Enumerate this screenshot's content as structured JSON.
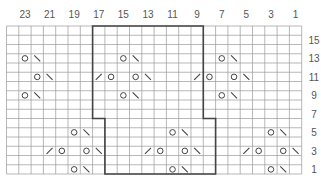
{
  "chart_title": "Knitting lace chart",
  "grid": {
    "columns": 24,
    "rows": 16,
    "left": 6.5,
    "top": 26,
    "cell_w": 12.3,
    "cell_h": 9.25,
    "line_color": "#999999",
    "outline_color": "#444444",
    "symbol_color": "#444444"
  },
  "column_labels": [
    "23",
    "21",
    "19",
    "17",
    "15",
    "13",
    "11",
    "9",
    "7",
    "5",
    "3",
    "1"
  ],
  "row_labels": [
    "15",
    "13",
    "11",
    "9",
    "7",
    "5",
    "3",
    "1"
  ],
  "legend_symbols": {
    "O": "yarn-over",
    "\\": "left-leaning decrease",
    "/": "right-leaning decrease"
  },
  "symbols": [
    {
      "row": 13,
      "col": 1,
      "s": "O"
    },
    {
      "row": 13,
      "col": 2,
      "s": "\\"
    },
    {
      "row": 13,
      "col": 9,
      "s": "O"
    },
    {
      "row": 13,
      "col": 10,
      "s": "\\"
    },
    {
      "row": 13,
      "col": 17,
      "s": "O"
    },
    {
      "row": 13,
      "col": 18,
      "s": "\\"
    },
    {
      "row": 11,
      "col": 2,
      "s": "O"
    },
    {
      "row": 11,
      "col": 3,
      "s": "\\"
    },
    {
      "row": 11,
      "col": 7,
      "s": "/"
    },
    {
      "row": 11,
      "col": 8,
      "s": "O"
    },
    {
      "row": 11,
      "col": 10,
      "s": "O"
    },
    {
      "row": 11,
      "col": 11,
      "s": "\\"
    },
    {
      "row": 11,
      "col": 15,
      "s": "/"
    },
    {
      "row": 11,
      "col": 16,
      "s": "O"
    },
    {
      "row": 11,
      "col": 18,
      "s": "O"
    },
    {
      "row": 11,
      "col": 19,
      "s": "\\"
    },
    {
      "row": 9,
      "col": 1,
      "s": "O"
    },
    {
      "row": 9,
      "col": 2,
      "s": "\\"
    },
    {
      "row": 9,
      "col": 9,
      "s": "O"
    },
    {
      "row": 9,
      "col": 10,
      "s": "\\"
    },
    {
      "row": 9,
      "col": 17,
      "s": "O"
    },
    {
      "row": 9,
      "col": 18,
      "s": "\\"
    },
    {
      "row": 5,
      "col": 5,
      "s": "O"
    },
    {
      "row": 5,
      "col": 6,
      "s": "\\"
    },
    {
      "row": 5,
      "col": 13,
      "s": "O"
    },
    {
      "row": 5,
      "col": 14,
      "s": "\\"
    },
    {
      "row": 5,
      "col": 21,
      "s": "O"
    },
    {
      "row": 5,
      "col": 22,
      "s": "\\"
    },
    {
      "row": 3,
      "col": 3,
      "s": "/"
    },
    {
      "row": 3,
      "col": 4,
      "s": "O"
    },
    {
      "row": 3,
      "col": 6,
      "s": "O"
    },
    {
      "row": 3,
      "col": 7,
      "s": "\\"
    },
    {
      "row": 3,
      "col": 11,
      "s": "/"
    },
    {
      "row": 3,
      "col": 12,
      "s": "O"
    },
    {
      "row": 3,
      "col": 14,
      "s": "O"
    },
    {
      "row": 3,
      "col": 15,
      "s": "\\"
    },
    {
      "row": 3,
      "col": 19,
      "s": "/"
    },
    {
      "row": 3,
      "col": 20,
      "s": "O"
    },
    {
      "row": 3,
      "col": 22,
      "s": "O"
    },
    {
      "row": 3,
      "col": 23,
      "s": "\\"
    },
    {
      "row": 1,
      "col": 5,
      "s": "O"
    },
    {
      "row": 1,
      "col": 6,
      "s": "\\"
    },
    {
      "row": 1,
      "col": 13,
      "s": "O"
    },
    {
      "row": 1,
      "col": 14,
      "s": "\\"
    },
    {
      "row": 1,
      "col": 21,
      "s": "O"
    },
    {
      "row": 1,
      "col": 22,
      "s": "\\"
    }
  ],
  "repeat_outline": {
    "description": "Bold outline marking pattern repeat; columns 7-15 for rows 16-7, columns 8-16 for rows 6-1",
    "upper": {
      "col_start": 7,
      "col_end": 15,
      "row_top": 16,
      "row_bottom": 7
    },
    "lower": {
      "col_start": 8,
      "col_end": 16,
      "row_top": 6,
      "row_bottom": 1
    }
  }
}
